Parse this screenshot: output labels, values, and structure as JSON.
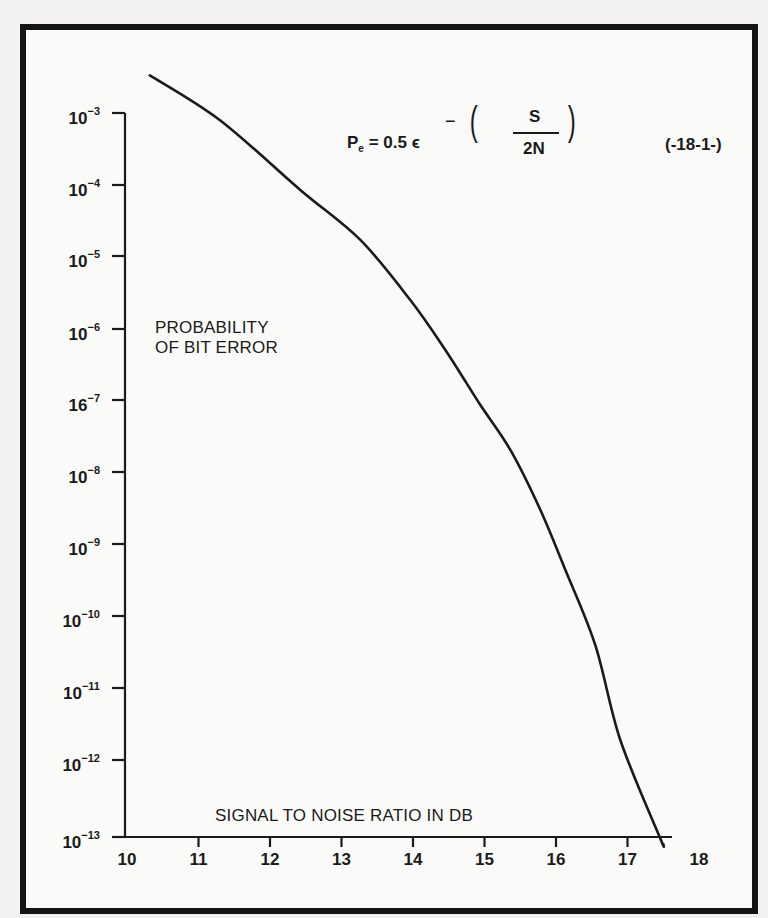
{
  "chart_data": {
    "type": "line",
    "title": "",
    "formula": {
      "lhs": "P",
      "lhs_subscript": "e",
      "equals_text": "= 0.5 ϵ",
      "exponent_sign": "−",
      "numerator": "S",
      "denominator": "2N",
      "equation_number": "(-18-1-)"
    },
    "xlabel": "SIGNAL TO NOISE RATIO IN DB",
    "ylabel_line1": "PROBABILITY",
    "ylabel_line2": "OF BIT ERROR",
    "xscale": "linear",
    "yscale": "log",
    "xlim": [
      10,
      18
    ],
    "ylim": [
      1e-13,
      0.001
    ],
    "grid": false,
    "legend": null,
    "x_ticks": [
      "10",
      "11",
      "12",
      "13",
      "14",
      "15",
      "16",
      "17",
      "18"
    ],
    "y_ticks": [
      {
        "base": "10",
        "exp": "−3"
      },
      {
        "base": "10",
        "exp": "−4"
      },
      {
        "base": "10",
        "exp": "−5"
      },
      {
        "base": "10",
        "exp": "−6"
      },
      {
        "base": "16",
        "exp": "−7"
      },
      {
        "base": "10",
        "exp": "−8"
      },
      {
        "base": "10",
        "exp": "−9"
      },
      {
        "base": "10",
        "exp": "−10"
      },
      {
        "base": "10",
        "exp": "−11"
      },
      {
        "base": "10",
        "exp": "−12"
      },
      {
        "base": "10",
        "exp": "−13"
      }
    ],
    "series": [
      {
        "name": "Pe",
        "x": [
          10.32,
          11.3,
          12.42,
          13.26,
          13.96,
          14.45,
          14.94,
          15.36,
          15.78,
          16.13,
          16.55,
          16.9,
          17.45,
          17.5
        ],
        "log10_y": [
          -2.48,
          -3.1,
          -4.06,
          -4.75,
          -5.58,
          -6.27,
          -7.03,
          -7.65,
          -8.48,
          -9.31,
          -10.35,
          -11.66,
          -13.0,
          -13.1
        ]
      }
    ]
  },
  "colors": {
    "ink": "#1a1a1a",
    "paper": "#fafaf8",
    "frame": "#141414"
  }
}
